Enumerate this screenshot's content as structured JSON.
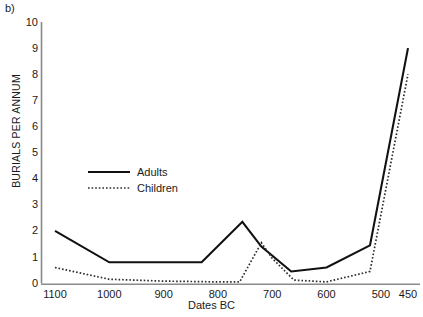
{
  "panel": {
    "label": "b)"
  },
  "chart_data": {
    "type": "line",
    "title": "",
    "xlabel": "Dates BC",
    "ylabel": "BURIALS PER ANNUM",
    "xlim": [
      1100,
      450
    ],
    "ylim": [
      0,
      10
    ],
    "x_reversed": true,
    "grid": false,
    "legend_position": "center-left-inside",
    "xticks": [
      1100,
      1000,
      900,
      800,
      700,
      600,
      500,
      450
    ],
    "xtick_labels": [
      "1100",
      "1000",
      "900",
      "800",
      "700",
      "600",
      "500",
      "450"
    ],
    "yticks": [
      0,
      1,
      2,
      3,
      4,
      5,
      6,
      7,
      8,
      9,
      10
    ],
    "ytick_labels": [
      "0",
      "1",
      "2",
      "3",
      "4",
      "5",
      "6",
      "7",
      "8",
      "9",
      "10"
    ],
    "series": [
      {
        "name": "Adults",
        "style": "solid",
        "color": "#111111",
        "x": [
          1100,
          1000,
          830,
          755,
          720,
          665,
          600,
          520,
          450
        ],
        "values": [
          2.0,
          0.8,
          0.8,
          2.35,
          1.4,
          0.45,
          0.6,
          1.45,
          9.0
        ]
      },
      {
        "name": "Children",
        "style": "dotted",
        "color": "#333333",
        "x": [
          1100,
          1000,
          900,
          800,
          760,
          720,
          700,
          660,
          600,
          520,
          450
        ],
        "values": [
          0.6,
          0.15,
          0.08,
          0.05,
          0.05,
          1.55,
          0.95,
          0.12,
          0.05,
          0.45,
          8.0
        ]
      }
    ],
    "legend": [
      {
        "label": "Adults",
        "style": "solid"
      },
      {
        "label": "Children",
        "style": "dotted"
      }
    ]
  }
}
